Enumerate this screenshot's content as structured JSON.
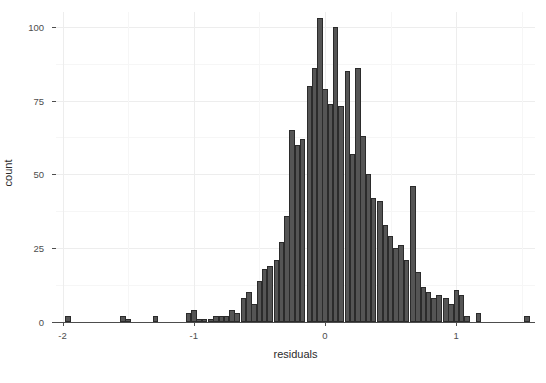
{
  "chart_data": {
    "type": "bar",
    "title": "",
    "subtitle": "",
    "xlabel": "residuals",
    "ylabel": "count",
    "xlim": [
      -2.05,
      1.6
    ],
    "ylim": [
      0,
      105
    ],
    "grid": true,
    "legend": null,
    "binwidth": 0.042,
    "x_ticks": [
      -2,
      -1,
      0,
      1
    ],
    "x_tick_labels": [
      "-2",
      "-1",
      "0",
      "1"
    ],
    "y_ticks": [
      0,
      25,
      50,
      75,
      100
    ],
    "y_tick_labels": [
      "0",
      "25",
      "50",
      "75",
      "100"
    ],
    "y_minor_ticks": [
      12.5,
      37.5,
      62.5,
      87.5
    ],
    "bar_fill": "#555555",
    "bar_outline": "#2b2b2b",
    "panel_background": "#ffffff",
    "grid_major_color": "#ededed",
    "grid_minor_color": "#f6f6f6",
    "axis_color": "#4d4d4d",
    "x": [
      -1.96,
      -1.54,
      -1.5,
      -1.29,
      -1.04,
      -1.0,
      -0.96,
      -0.92,
      -0.87,
      -0.83,
      -0.79,
      -0.75,
      -0.71,
      -0.67,
      -0.62,
      -0.58,
      -0.54,
      -0.5,
      -0.46,
      -0.42,
      -0.37,
      -0.33,
      -0.29,
      -0.25,
      -0.21,
      -0.17,
      -0.12,
      -0.08,
      -0.04,
      0.0,
      0.04,
      0.08,
      0.12,
      0.17,
      0.21,
      0.25,
      0.29,
      0.33,
      0.37,
      0.42,
      0.46,
      0.5,
      0.54,
      0.58,
      0.62,
      0.67,
      0.71,
      0.75,
      0.79,
      0.83,
      0.87,
      0.92,
      0.96,
      1.0,
      1.04,
      1.08,
      1.17,
      1.54
    ],
    "values": [
      2,
      2,
      1,
      2,
      3,
      4,
      1,
      1,
      1,
      2,
      2,
      2,
      4,
      3,
      8,
      10,
      6,
      14,
      18,
      19,
      21,
      27,
      36,
      65,
      60,
      62,
      80,
      86,
      103,
      79,
      74,
      100,
      73,
      85,
      57,
      86,
      63,
      50,
      42,
      41,
      33,
      29,
      25,
      26,
      21,
      46,
      17,
      12,
      10,
      8,
      9,
      8,
      6,
      11,
      9,
      2,
      3,
      2
    ]
  }
}
